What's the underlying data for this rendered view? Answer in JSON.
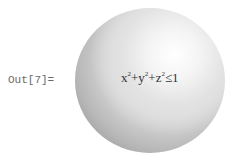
{
  "output_cell": {
    "label": "Out[7]=",
    "graphic": {
      "type": "sphere-region",
      "inequality": {
        "terms": [
          {
            "var": "x",
            "exp": "2"
          },
          {
            "op": "+"
          },
          {
            "var": "y",
            "exp": "2"
          },
          {
            "op": "+"
          },
          {
            "var": "z",
            "exp": "2"
          }
        ],
        "relation": "≤",
        "rhs": "1"
      }
    }
  }
}
